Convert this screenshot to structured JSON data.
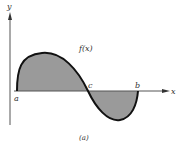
{
  "figure": {
    "caption": "(a)",
    "function_label": "f(x)",
    "axes": {
      "x_label": "x",
      "y_label": "y"
    },
    "points": {
      "a": "a",
      "b": "b",
      "c": "c"
    },
    "colors": {
      "curve": "#111111",
      "shade": "#9a9a9a",
      "axis": "#555555"
    }
  }
}
